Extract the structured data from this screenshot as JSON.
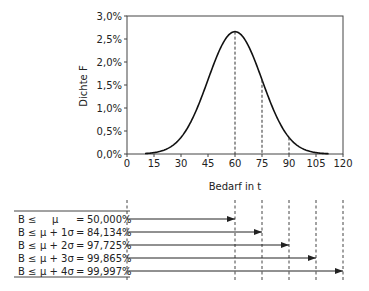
{
  "chart_data": {
    "type": "line",
    "title": "",
    "xlabel": "Bedarf in t",
    "ylabel": "Dichte F",
    "xlim": [
      0,
      120
    ],
    "ylim": [
      0,
      0.03
    ],
    "x_ticks": [
      0,
      15,
      30,
      45,
      60,
      75,
      90,
      105,
      120
    ],
    "x_tick_labels": [
      "0",
      "15",
      "30",
      "45",
      "60",
      "75",
      "90",
      "105",
      "120"
    ],
    "y_ticks": [
      0,
      0.005,
      0.01,
      0.015,
      0.02,
      0.025,
      0.03
    ],
    "y_tick_labels": [
      "0,0%",
      "0,5%",
      "1,0%",
      "1,5%",
      "2,0%",
      "2,5%",
      "3,0%"
    ],
    "grid": false,
    "series": [
      {
        "name": "Normalverteilung",
        "mu": 60,
        "sigma": 15,
        "x_range": [
          10,
          112
        ],
        "peak_value": 0.0266
      }
    ],
    "reference_lines_x": [
      60,
      75,
      90
    ],
    "annotation_lines_x": [
      0,
      60,
      75,
      90,
      105,
      120
    ]
  },
  "table": {
    "rows": [
      {
        "lhs": "B ≤",
        "expr": "μ",
        "eq": "=",
        "value": "50,000%",
        "arrow_to": 60
      },
      {
        "lhs": "B ≤",
        "expr": "μ + 1σ",
        "eq": "=",
        "value": "84,134%",
        "arrow_to": 75
      },
      {
        "lhs": "B ≤",
        "expr": "μ + 2σ",
        "eq": "=",
        "value": "97,725%",
        "arrow_to": 90
      },
      {
        "lhs": "B ≤",
        "expr": "μ + 3σ",
        "eq": "=",
        "value": "99,865%",
        "arrow_to": 105
      },
      {
        "lhs": "B ≤",
        "expr": "μ + 4σ",
        "eq": "=",
        "value": "99,997%",
        "arrow_to": 120
      }
    ]
  }
}
